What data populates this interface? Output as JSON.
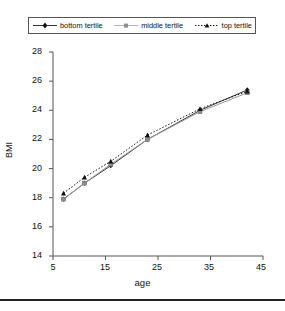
{
  "chart_data": {
    "type": "line",
    "title": "",
    "xlabel": "age",
    "ylabel": "BMI",
    "xlim": [
      5,
      45
    ],
    "ylim": [
      14,
      28
    ],
    "xticks": [
      5,
      15,
      25,
      35,
      45
    ],
    "yticks": [
      14,
      16,
      18,
      20,
      22,
      24,
      26,
      28
    ],
    "grid": false,
    "legend_position": "top",
    "x": [
      7,
      11,
      16,
      23,
      33,
      42
    ],
    "series": [
      {
        "name": "bottom tertile",
        "marker": "diamond",
        "linestyle": "solid",
        "color": "#333333",
        "values": [
          17.9,
          19.0,
          20.2,
          22.0,
          24.0,
          25.4
        ]
      },
      {
        "name": "middle tertile",
        "marker": "square",
        "linestyle": "solid",
        "color": "#9a9a9a",
        "values": [
          17.9,
          19.0,
          20.3,
          22.0,
          23.9,
          25.2
        ]
      },
      {
        "name": "top tertile",
        "marker": "triangle",
        "linestyle": "dotted",
        "color": "#111111",
        "values": [
          18.3,
          19.4,
          20.5,
          22.3,
          24.1,
          25.3
        ]
      }
    ]
  },
  "legend": {
    "entries": [
      {
        "label": "bottom tertile"
      },
      {
        "label": "middle tertile"
      },
      {
        "label": "top tertile"
      }
    ]
  },
  "axes": {
    "y_title": "BMI",
    "x_title": "age",
    "y_tick_labels": [
      "28",
      "26",
      "24",
      "22",
      "20",
      "18",
      "16",
      "14"
    ],
    "x_tick_labels": [
      "5",
      "15",
      "25",
      "35",
      "45"
    ]
  }
}
